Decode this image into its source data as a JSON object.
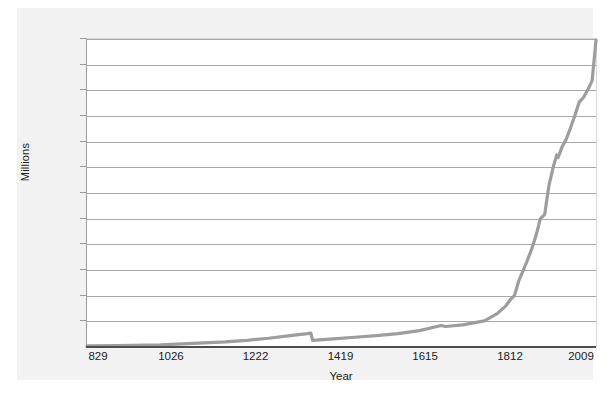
{
  "figure": {
    "caption": "",
    "panel_bg": "#f2f2f2",
    "plot_bg": "#ffffff",
    "line_color": "#9d9d9d",
    "grid_color": "#a9a9a9",
    "axis_color": "#4d4d4d"
  },
  "chart_data": {
    "type": "line",
    "title": "",
    "xlabel": "Year",
    "ylabel": "Millions",
    "xlim": [
      829,
      2009
    ],
    "ylim": [
      1,
      61
    ],
    "grid": "horizontal",
    "legend": "none",
    "xticks": [
      829,
      1026,
      1222,
      1419,
      1615,
      1812,
      2009
    ],
    "xtick_labels": [
      "829",
      "1026",
      "1222",
      "1419",
      "1615",
      "1812",
      "2009"
    ],
    "yticks": [
      1,
      6,
      11,
      16,
      21,
      26,
      31,
      36,
      41,
      46,
      51,
      56,
      61
    ],
    "ytick_labels": [
      "1",
      "6",
      "11",
      "16",
      "21",
      "26",
      "31",
      "36",
      "41",
      "46",
      "51",
      "56",
      "61"
    ],
    "series": [
      {
        "name": "Population",
        "color": "#9d9d9d",
        "x": [
          829,
          900,
          1000,
          1050,
          1100,
          1150,
          1200,
          1250,
          1300,
          1340,
          1348,
          1352,
          1400,
          1450,
          1500,
          1550,
          1600,
          1650,
          1660,
          1700,
          1750,
          1780,
          1800,
          1810,
          1820,
          1830,
          1840,
          1850,
          1860,
          1870,
          1880,
          1890,
          1900,
          1910,
          1918,
          1921,
          1930,
          1940,
          1950,
          1960,
          1970,
          1980,
          1990,
          2000,
          2009
        ],
        "y": [
          1.2,
          1.25,
          1.4,
          1.6,
          1.8,
          2.0,
          2.3,
          2.7,
          3.2,
          3.6,
          3.7,
          2.3,
          2.6,
          2.9,
          3.2,
          3.6,
          4.2,
          5.2,
          5.0,
          5.3,
          6.1,
          7.5,
          9.0,
          10.2,
          11.0,
          13.9,
          15.9,
          17.9,
          20.1,
          22.7,
          26.0,
          26.8,
          32.5,
          36.1,
          38.4,
          37.9,
          39.9,
          41.5,
          43.7,
          46.1,
          48.7,
          49.6,
          51.1,
          52.9,
          60.8
        ]
      }
    ]
  }
}
